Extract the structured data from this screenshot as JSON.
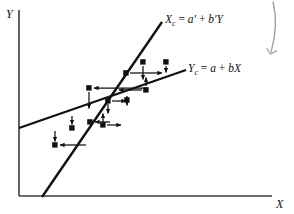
{
  "figure": {
    "width": 294,
    "height": 214,
    "background": "#ffffff",
    "ink": "#111111",
    "annotation_color": "#9a9a9a"
  },
  "axes": {
    "y_label": "Y",
    "x_label": "X",
    "x_axis": {
      "x1": 19,
      "y1": 196,
      "x2": 272,
      "y2": 196
    },
    "y_axis": {
      "x1": 19,
      "y1": 10,
      "x2": 19,
      "y2": 196
    }
  },
  "chart_data": {
    "type": "scatter",
    "title": "",
    "xlabel": "X",
    "ylabel": "Y",
    "grid": false,
    "legend": "inline-line-labels",
    "points": [
      {
        "x": 55,
        "y": 145
      },
      {
        "x": 72,
        "y": 128
      },
      {
        "x": 90,
        "y": 122
      },
      {
        "x": 103,
        "y": 125
      },
      {
        "x": 89,
        "y": 88
      },
      {
        "x": 108,
        "y": 101
      },
      {
        "x": 127,
        "y": 100
      },
      {
        "x": 126,
        "y": 73
      },
      {
        "x": 143,
        "y": 62
      },
      {
        "x": 146,
        "y": 90
      },
      {
        "x": 166,
        "y": 62
      }
    ],
    "vertical_deviations": [
      {
        "x": 72,
        "from": 116,
        "to": 125
      },
      {
        "x": 103,
        "from": 122,
        "to": 113
      },
      {
        "x": 89,
        "from": 92,
        "to": 110
      },
      {
        "x": 108,
        "from": 104,
        "to": 114
      },
      {
        "x": 127,
        "from": 96,
        "to": 106
      },
      {
        "x": 143,
        "from": 66,
        "to": 80
      },
      {
        "x": 146,
        "from": 86,
        "to": 77
      },
      {
        "x": 166,
        "from": 66,
        "to": 73
      },
      {
        "x": 55,
        "from": 132,
        "to": 141
      }
    ],
    "horizontal_deviations": [
      {
        "y": 145,
        "from": 59,
        "to": 86
      },
      {
        "y": 122,
        "from": 94,
        "to": 110
      },
      {
        "y": 125,
        "from": 107,
        "to": 122
      },
      {
        "y": 88,
        "from": 93,
        "to": 147
      },
      {
        "y": 101,
        "from": 112,
        "to": 127
      },
      {
        "y": 73,
        "from": 130,
        "to": 163
      },
      {
        "y": 90,
        "from": 142,
        "to": 118
      }
    ],
    "lines": [
      {
        "name": "Xc-regression-line",
        "equation": "Xc = a' + b'Y",
        "label_html": "X<span class=\"sub\">c</span> <span class=\"rm\">=</span> a' <span class=\"rm\">+</span> b'Y",
        "x1": 42,
        "y1": 197,
        "x2": 162,
        "y2": 22,
        "stroke_width": 2.1
      },
      {
        "name": "Yc-regression-line",
        "equation": "Yc = a + bX",
        "label_html": "Y<span class=\"sub\">c</span> <span class=\"rm\">=</span> a <span class=\"rm\">+</span> bX",
        "x1": 19,
        "y1": 128,
        "x2": 186,
        "y2": 70,
        "stroke_width": 2.1
      }
    ]
  },
  "annotations": {
    "curved_arrow": {
      "name": "hand-drawn-down-arrow",
      "color": "#9a9a9a",
      "description": "curved arrow pointing down at top-right"
    }
  },
  "labels": {
    "equation_xc_text": "Xc = a' + b'Y",
    "equation_yc_text": "Yc = a + bX"
  }
}
